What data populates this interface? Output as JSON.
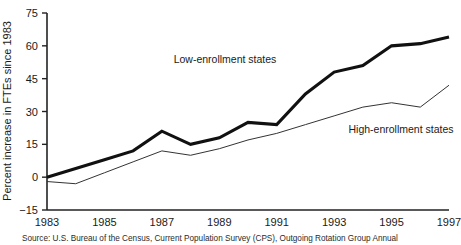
{
  "chart_data": {
    "type": "line",
    "title": "",
    "xlabel": "",
    "ylabel": "Percent increase in FTEs since 1983",
    "xlim": [
      1983,
      1997
    ],
    "ylim": [
      -15,
      75
    ],
    "yticks": [
      -15,
      0,
      15,
      30,
      45,
      60,
      75
    ],
    "ytick_labels": [
      "−15",
      "0",
      "15",
      "30",
      "45",
      "60",
      "75"
    ],
    "xticks": [
      1983,
      1985,
      1987,
      1989,
      1991,
      1993,
      1995,
      1997
    ],
    "xtick_labels": [
      "1983",
      "1985",
      "1987",
      "1989",
      "1991",
      "1993",
      "1995",
      "1997"
    ],
    "x": [
      1983,
      1984,
      1985,
      1986,
      1987,
      1988,
      1989,
      1990,
      1991,
      1992,
      1993,
      1994,
      1995,
      1996,
      1997
    ],
    "grid": false,
    "legend_position": "inline-annotation",
    "series": [
      {
        "name": "Low-enrollment states",
        "style": "thick",
        "values": [
          0,
          4,
          8,
          12,
          21,
          15,
          18,
          25,
          24,
          38,
          48,
          51,
          60,
          61,
          64
        ]
      },
      {
        "name": "High-enrollment states",
        "style": "thin",
        "values": [
          -2,
          -3,
          2,
          7,
          12,
          10,
          13,
          17,
          20,
          24,
          28,
          32,
          34,
          32,
          42
        ]
      }
    ],
    "annotations": [
      {
        "text": "Low-enrollment states",
        "x": 1989.2,
        "y": 52
      },
      {
        "text": "High-enrollment states",
        "x": 1993.5,
        "y": 20
      }
    ]
  },
  "axes": {
    "ylabel": "Percent increase in FTEs since 1983"
  },
  "footer": {
    "source": "Source: U.S. Bureau of the Census, Current Population Survey (CPS), Outgoing Rotation Group Annual"
  }
}
